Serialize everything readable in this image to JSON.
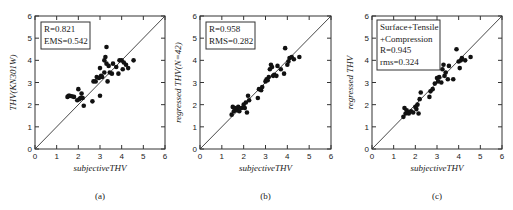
{
  "chart_data": [
    {
      "type": "scatter",
      "panel": "(a)",
      "caption": "(a)",
      "xlabel": "subjectiveTHV",
      "ylabel": "THV(KN301W)",
      "xlim": [
        0,
        6
      ],
      "ylim": [
        0,
        6
      ],
      "xticks": [
        0,
        1,
        2,
        3,
        4,
        5,
        6
      ],
      "yticks": [
        0,
        1,
        2,
        3,
        4,
        5,
        6
      ],
      "grid": false,
      "reference_line": "y = x",
      "legend": [
        "R=0.821",
        "EMS=0.542"
      ],
      "legend_position": "upper-left",
      "points": [
        [
          1.5,
          2.35
        ],
        [
          1.55,
          2.4
        ],
        [
          1.6,
          2.4
        ],
        [
          1.7,
          2.38
        ],
        [
          1.8,
          2.35
        ],
        [
          1.95,
          2.2
        ],
        [
          2.0,
          2.7
        ],
        [
          2.05,
          2.25
        ],
        [
          2.1,
          2.3
        ],
        [
          2.15,
          2.5
        ],
        [
          2.2,
          2.3
        ],
        [
          2.25,
          1.95
        ],
        [
          2.65,
          2.15
        ],
        [
          2.7,
          3.05
        ],
        [
          2.8,
          3.05
        ],
        [
          2.85,
          3.25
        ],
        [
          2.95,
          3.2
        ],
        [
          3.0,
          2.4
        ],
        [
          3.0,
          3.65
        ],
        [
          3.05,
          3.3
        ],
        [
          3.1,
          3.25
        ],
        [
          3.2,
          3.45
        ],
        [
          3.2,
          4.0
        ],
        [
          3.25,
          4.15
        ],
        [
          3.3,
          3.85
        ],
        [
          3.3,
          4.6
        ],
        [
          3.35,
          3.05
        ],
        [
          3.4,
          3.75
        ],
        [
          3.45,
          3.45
        ],
        [
          3.55,
          3.4
        ],
        [
          3.6,
          3.85
        ],
        [
          3.75,
          3.7
        ],
        [
          3.85,
          3.4
        ],
        [
          3.9,
          4.0
        ],
        [
          4.0,
          4.0
        ],
        [
          4.05,
          3.6
        ],
        [
          4.1,
          3.9
        ],
        [
          4.2,
          3.8
        ],
        [
          4.3,
          3.65
        ],
        [
          4.55,
          4.0
        ]
      ]
    },
    {
      "type": "scatter",
      "panel": "(b)",
      "caption": "(b)",
      "xlabel": "subjectiveTHV",
      "ylabel": "regressed THV(N=42)",
      "xlim": [
        0,
        6
      ],
      "ylim": [
        0,
        6
      ],
      "xticks": [
        0,
        1,
        2,
        3,
        4,
        5,
        6
      ],
      "yticks": [
        0,
        1,
        2,
        3,
        4,
        5,
        6
      ],
      "grid": false,
      "reference_line": "y = x",
      "legend": [
        "R=0.958",
        "RMS=0.282"
      ],
      "legend_position": "upper-left",
      "points": [
        [
          1.45,
          1.55
        ],
        [
          1.5,
          1.9
        ],
        [
          1.55,
          1.7
        ],
        [
          1.6,
          1.85
        ],
        [
          1.7,
          1.75
        ],
        [
          1.75,
          1.9
        ],
        [
          1.8,
          1.7
        ],
        [
          1.9,
          1.85
        ],
        [
          2.0,
          2.0
        ],
        [
          2.05,
          1.85
        ],
        [
          2.1,
          2.1
        ],
        [
          2.15,
          1.65
        ],
        [
          2.2,
          2.4
        ],
        [
          2.25,
          2.2
        ],
        [
          2.65,
          2.3
        ],
        [
          2.7,
          2.7
        ],
        [
          2.8,
          2.65
        ],
        [
          2.85,
          2.8
        ],
        [
          3.0,
          3.05
        ],
        [
          3.05,
          3.15
        ],
        [
          3.1,
          3.1
        ],
        [
          3.15,
          3.25
        ],
        [
          3.2,
          3.6
        ],
        [
          3.25,
          3.8
        ],
        [
          3.3,
          3.7
        ],
        [
          3.35,
          3.3
        ],
        [
          3.4,
          3.35
        ],
        [
          3.5,
          3.3
        ],
        [
          3.55,
          3.75
        ],
        [
          3.7,
          3.6
        ],
        [
          3.85,
          3.4
        ],
        [
          3.9,
          4.55
        ],
        [
          4.0,
          3.8
        ],
        [
          4.05,
          3.95
        ],
        [
          4.1,
          4.1
        ],
        [
          4.2,
          4.15
        ],
        [
          4.3,
          4.05
        ],
        [
          4.55,
          4.15
        ]
      ]
    },
    {
      "type": "scatter",
      "panel": "(c)",
      "caption": "(c)",
      "xlabel": "subjectiveTHV",
      "ylabel": "regressed THV",
      "xlim": [
        0,
        6
      ],
      "ylim": [
        0,
        6
      ],
      "xticks": [
        0,
        1,
        2,
        3,
        4,
        5,
        6
      ],
      "yticks": [
        0,
        1,
        2,
        3,
        4,
        5,
        6
      ],
      "grid": false,
      "reference_line": "y = x",
      "legend": [
        "Surface+Tensile",
        "+Compression",
        "R=0.945",
        "rms=0.324"
      ],
      "legend_position": "upper-left",
      "points": [
        [
          1.45,
          1.45
        ],
        [
          1.5,
          1.85
        ],
        [
          1.55,
          1.6
        ],
        [
          1.6,
          1.75
        ],
        [
          1.65,
          1.65
        ],
        [
          1.7,
          1.6
        ],
        [
          1.8,
          1.7
        ],
        [
          1.9,
          1.65
        ],
        [
          2.0,
          1.9
        ],
        [
          2.05,
          1.8
        ],
        [
          2.1,
          2.0
        ],
        [
          2.15,
          1.6
        ],
        [
          2.2,
          2.25
        ],
        [
          2.25,
          2.55
        ],
        [
          2.65,
          2.35
        ],
        [
          2.7,
          2.6
        ],
        [
          2.8,
          2.7
        ],
        [
          2.9,
          2.95
        ],
        [
          3.0,
          3.2
        ],
        [
          3.05,
          3.05
        ],
        [
          3.1,
          3.25
        ],
        [
          3.2,
          3.0
        ],
        [
          3.25,
          3.6
        ],
        [
          3.3,
          3.8
        ],
        [
          3.35,
          3.3
        ],
        [
          3.4,
          3.45
        ],
        [
          3.5,
          3.15
        ],
        [
          3.55,
          3.75
        ],
        [
          3.75,
          3.15
        ],
        [
          3.9,
          4.5
        ],
        [
          4.0,
          3.95
        ],
        [
          4.05,
          3.65
        ],
        [
          4.1,
          4.0
        ],
        [
          4.15,
          4.1
        ],
        [
          4.3,
          4.0
        ],
        [
          4.55,
          4.15
        ]
      ]
    }
  ]
}
